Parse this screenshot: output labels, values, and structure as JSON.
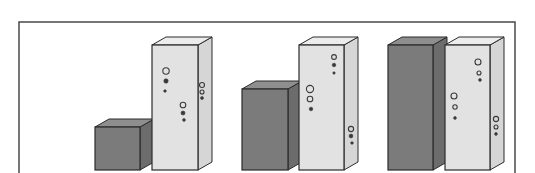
{
  "figure": {
    "width": 535,
    "height": 173,
    "background": "#ffffff",
    "frame": {
      "left": 19,
      "top": 22,
      "right": 515,
      "stroke": "#4a4a4a",
      "stroke_width": 1.5
    },
    "colors": {
      "dark_front": "#7b7b7b",
      "dark_top": "#8e8e8e",
      "dark_side": "#6c6c6c",
      "light_front": "#e2e2e2",
      "light_top": "#ececec",
      "light_side": "#d6d6d6",
      "edge": "#2b2b2b",
      "bubble": "#3a3a3a"
    },
    "depth": {
      "dx": 14,
      "dy": 8
    },
    "baseline": 170
  },
  "groups": [
    {
      "name": "group-1",
      "bars": [
        {
          "kind": "dark",
          "x": 95,
          "width": 45,
          "top": 127,
          "bubbles": []
        },
        {
          "kind": "light",
          "x": 152,
          "width": 46,
          "top": 45,
          "bubbles": [
            {
              "cx": 166,
              "cy": 71,
              "r": 3.2,
              "hollow": true
            },
            {
              "cx": 166,
              "cy": 81,
              "r": 2.2,
              "hollow": false
            },
            {
              "cx": 165,
              "cy": 91,
              "r": 1.3,
              "hollow": false
            },
            {
              "cx": 183,
              "cy": 105,
              "r": 2.8,
              "hollow": true
            },
            {
              "cx": 183,
              "cy": 113,
              "r": 2.0,
              "hollow": false
            },
            {
              "cx": 184,
              "cy": 120,
              "r": 1.4,
              "hollow": false
            },
            {
              "cx": 202,
              "cy": 85,
              "r": 2.5,
              "hollow": true
            },
            {
              "cx": 202,
              "cy": 92,
              "r": 2.0,
              "hollow": true
            },
            {
              "cx": 202,
              "cy": 98,
              "r": 1.5,
              "hollow": false
            }
          ]
        }
      ]
    },
    {
      "name": "group-2",
      "bars": [
        {
          "kind": "dark",
          "x": 242,
          "width": 46,
          "top": 89,
          "bubbles": []
        },
        {
          "kind": "light",
          "x": 299,
          "width": 45,
          "top": 45,
          "bubbles": [
            {
              "cx": 334,
              "cy": 57,
              "r": 2.4,
              "hollow": true
            },
            {
              "cx": 334,
              "cy": 65,
              "r": 1.8,
              "hollow": false
            },
            {
              "cx": 334,
              "cy": 73,
              "r": 1.2,
              "hollow": false
            },
            {
              "cx": 310,
              "cy": 89,
              "r": 3.6,
              "hollow": true
            },
            {
              "cx": 310,
              "cy": 99,
              "r": 2.8,
              "hollow": true
            },
            {
              "cx": 311,
              "cy": 109,
              "r": 1.8,
              "hollow": false
            },
            {
              "cx": 351,
              "cy": 129,
              "r": 2.6,
              "hollow": true
            },
            {
              "cx": 351,
              "cy": 136,
              "r": 1.9,
              "hollow": false
            },
            {
              "cx": 352,
              "cy": 143,
              "r": 1.3,
              "hollow": false
            }
          ]
        }
      ]
    },
    {
      "name": "group-3",
      "bars": [
        {
          "kind": "dark",
          "x": 388,
          "width": 45,
          "top": 45,
          "bubbles": []
        },
        {
          "kind": "light",
          "x": 445,
          "width": 45,
          "top": 45,
          "bubbles": [
            {
              "cx": 478,
              "cy": 62,
              "r": 3.0,
              "hollow": true
            },
            {
              "cx": 479,
              "cy": 73,
              "r": 2.0,
              "hollow": true
            },
            {
              "cx": 480,
              "cy": 80,
              "r": 1.4,
              "hollow": false
            },
            {
              "cx": 454,
              "cy": 96,
              "r": 3.0,
              "hollow": true
            },
            {
              "cx": 455,
              "cy": 107,
              "r": 2.2,
              "hollow": true
            },
            {
              "cx": 455,
              "cy": 118,
              "r": 1.4,
              "hollow": false
            },
            {
              "cx": 496,
              "cy": 119,
              "r": 2.6,
              "hollow": true
            },
            {
              "cx": 496,
              "cy": 127,
              "r": 2.0,
              "hollow": true
            },
            {
              "cx": 496,
              "cy": 134,
              "r": 1.4,
              "hollow": false
            }
          ]
        }
      ]
    }
  ]
}
